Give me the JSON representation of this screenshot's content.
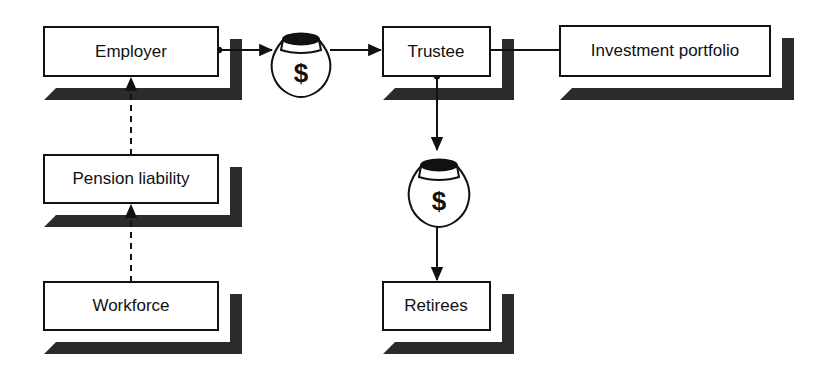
{
  "diagram": {
    "background_color": "#ffffff",
    "box_fill": "#ffffff",
    "box_stroke": "#111111",
    "shadow_color": "#2b2b2b",
    "line_color": "#111111",
    "nodes": [
      {
        "id": "employer",
        "label": "Employer",
        "x": 44,
        "y": 27,
        "w": 174,
        "h": 49
      },
      {
        "id": "pension-liability",
        "label": "Pension liability",
        "x": 44,
        "y": 155,
        "w": 174,
        "h": 48
      },
      {
        "id": "workforce",
        "label": "Workforce",
        "x": 44,
        "y": 282,
        "w": 174,
        "h": 48
      },
      {
        "id": "trustee",
        "label": "Trustee",
        "x": 383,
        "y": 27,
        "w": 107,
        "h": 49
      },
      {
        "id": "investment-portfolio",
        "label": "Investment portfolio",
        "x": 560,
        "y": 26,
        "w": 210,
        "h": 50
      },
      {
        "id": "retirees",
        "label": "Retirees",
        "x": 383,
        "y": 282,
        "w": 107,
        "h": 48
      }
    ],
    "money_bags": [
      {
        "id": "contribution-bag",
        "symbol": "$",
        "cx": 301,
        "cy": 62
      },
      {
        "id": "benefit-payment-bag",
        "symbol": "$",
        "cx": 439,
        "cy": 190
      }
    ],
    "connectors": [
      {
        "id": "employer-to-bag",
        "style": "solid",
        "arrow": true,
        "from": "employer",
        "to": "contribution-bag"
      },
      {
        "id": "bag-to-trustee",
        "style": "solid",
        "arrow": true,
        "from": "contribution-bag",
        "to": "trustee"
      },
      {
        "id": "trustee-to-portfolio",
        "style": "solid",
        "arrow": false,
        "from": "trustee",
        "to": "investment-portfolio"
      },
      {
        "id": "trustee-to-bag",
        "style": "solid",
        "arrow": true,
        "from": "trustee",
        "to": "benefit-payment-bag"
      },
      {
        "id": "bag-to-retirees",
        "style": "solid",
        "arrow": true,
        "from": "benefit-payment-bag",
        "to": "retirees"
      },
      {
        "id": "workforce-to-pension-liability",
        "style": "dashed",
        "arrow": true,
        "from": "workforce",
        "to": "pension-liability"
      },
      {
        "id": "pension-liability-to-employer",
        "style": "dashed",
        "arrow": true,
        "from": "pension-liability",
        "to": "employer"
      }
    ]
  }
}
